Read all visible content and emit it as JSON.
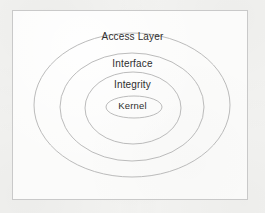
{
  "diagram": {
    "type": "concentric-ellipses",
    "title": "",
    "frame": {
      "border_color": "#c9c9c9",
      "background_color": "#fbfbfa"
    },
    "page_background_color": "#f4f4f2",
    "stroke_color": "#b3b3b3",
    "text_color": "#2e2e2e",
    "layers": [
      {
        "id": "access-layer",
        "label": "Access Layer",
        "order": 1,
        "position": "outermost",
        "cx": 132,
        "cy": 105,
        "rx": 98,
        "ry": 72,
        "label_x": 132,
        "label_y": 38
      },
      {
        "id": "interface",
        "label": "Interface",
        "order": 2,
        "position": "second",
        "cx": 132,
        "cy": 107,
        "rx": 72,
        "ry": 54,
        "label_x": 132,
        "label_y": 65
      },
      {
        "id": "integrity",
        "label": "Integrity",
        "order": 3,
        "position": "third",
        "cx": 133,
        "cy": 108,
        "rx": 48,
        "ry": 36,
        "label_x": 133,
        "label_y": 86
      },
      {
        "id": "kernel",
        "label": "Kernel",
        "order": 4,
        "position": "innermost",
        "cx": 134,
        "cy": 107,
        "rx": 28,
        "ry": 11,
        "label_x": 134,
        "label_y": 107
      }
    ]
  }
}
